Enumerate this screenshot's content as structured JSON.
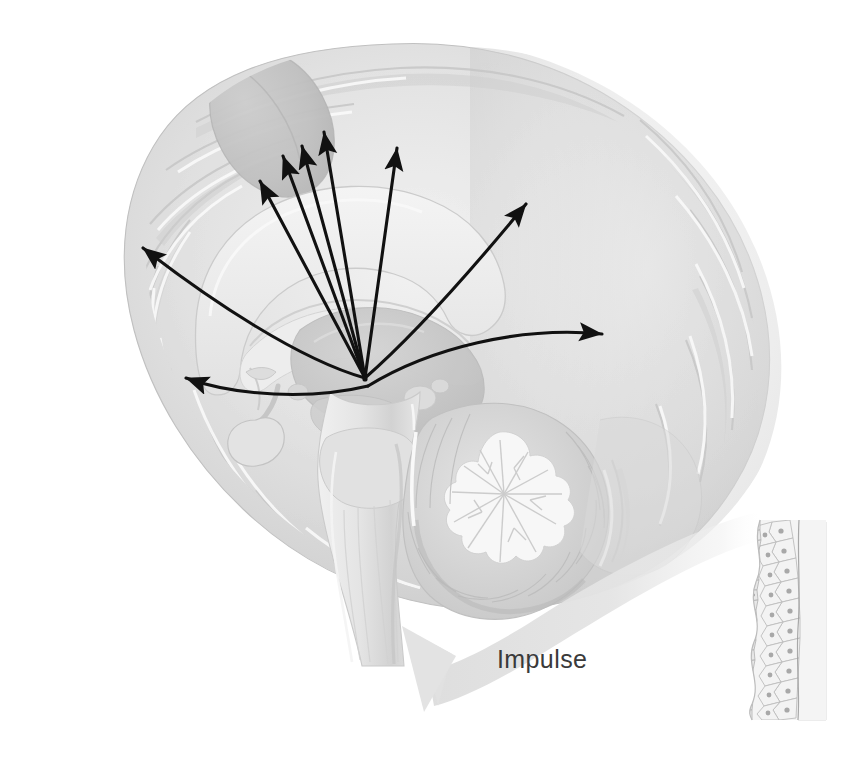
{
  "figure": {
    "background_color": "#ffffff"
  },
  "labels": {
    "impulse": "Impulse"
  },
  "colors": {
    "background": "#ffffff",
    "cortex_light": "#e6e6e6",
    "cortex_mid": "#d4d4d4",
    "cortex_shadow": "#bdbdbd",
    "white_matter": "#efefef",
    "corpus_callosum": "#e9e9e9",
    "thalamus": "#c9c9c9",
    "highlight_oval": "#bcbcbc",
    "brainstem": "#e2e2e2",
    "brainstem_shadow": "#cfcfcf",
    "cerebellum_cortex": "#d6d6d6",
    "cerebellum_arbor": "#f6f6f6",
    "pituitary": "#e0e0e0",
    "arrow_black": "#111111",
    "impulse_ribbon": "#e4e4e4",
    "tissue_cell_fill": "#f2f2f2",
    "tissue_cell_stroke": "#b9b9b9",
    "tissue_nucleus": "#a9a9a9",
    "tissue_band": "#e0e0e0",
    "text": "#3a3a3a"
  },
  "structures": [
    {
      "name": "cerebral-cortex",
      "description": "Cerebral hemisphere medial surface with gyri and sulci"
    },
    {
      "name": "corpus-callosum",
      "description": "Arched white matter commissure"
    },
    {
      "name": "thalamus",
      "description": "Central oval gray mass"
    },
    {
      "name": "hypothalamus",
      "description": "Convergence origin of radiating arrows"
    },
    {
      "name": "pituitary-gland",
      "description": "Gland suspended by infundibulum"
    },
    {
      "name": "midbrain",
      "description": "Upper brainstem"
    },
    {
      "name": "pons",
      "description": "Mid brainstem bulge"
    },
    {
      "name": "medulla-oblongata",
      "description": "Lower brainstem continuing to spinal cord"
    },
    {
      "name": "cerebellum",
      "description": "Arbor vitae branching pattern"
    },
    {
      "name": "epithelium-section",
      "description": "Stratified epithelial tissue cross-section at right"
    }
  ],
  "arrows": {
    "origin": {
      "x": 365,
      "y": 378
    },
    "items": [
      {
        "name": "arrow-up-left-1",
        "tip_x": 258,
        "tip_y": 178,
        "curved": false
      },
      {
        "name": "arrow-up-left-2",
        "tip_x": 281,
        "tip_y": 152,
        "curved": false
      },
      {
        "name": "arrow-up-mid-1",
        "tip_x": 300,
        "tip_y": 141,
        "curved": false
      },
      {
        "name": "arrow-up-mid-2",
        "tip_x": 322,
        "tip_y": 127,
        "curved": false
      },
      {
        "name": "arrow-up-right",
        "tip_x": 399,
        "tip_y": 142,
        "curved": false
      },
      {
        "name": "arrow-left-upper",
        "tip_x": 136,
        "tip_y": 243,
        "curved": true
      },
      {
        "name": "arrow-left-lower",
        "tip_x": 178,
        "tip_y": 375,
        "curved": true
      },
      {
        "name": "arrow-right-upper",
        "tip_x": 531,
        "tip_y": 198,
        "curved": true
      },
      {
        "name": "arrow-right-lower",
        "tip_x": 609,
        "tip_y": 336,
        "curved": true
      }
    ],
    "count": 9
  },
  "impulse_arrow": {
    "direction": "right-to-left",
    "from": "epithelium-section",
    "to": "brainstem",
    "label": "Impulse"
  }
}
